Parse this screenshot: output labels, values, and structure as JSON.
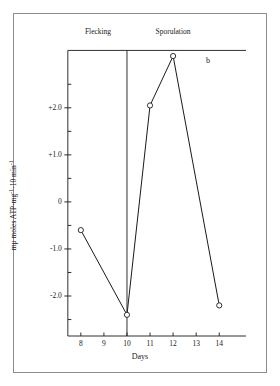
{
  "figure": {
    "panel_label": "b",
    "xlabel": "Days",
    "ylabel_html": "mμ moles ATP·mg⁻¹·10 min⁻¹",
    "region_left": "Flecking",
    "region_right": "Sporulation"
  },
  "chart_data": {
    "type": "line",
    "title": "",
    "subtitle": "",
    "xlabel": "Days",
    "ylabel": "mμ moles ATP·mg⁻¹·10 min⁻¹",
    "xlim": [
      7.4,
      14.9
    ],
    "ylim": [
      -2.85,
      3.25
    ],
    "grid": false,
    "legend": "none",
    "marker": "open-circle",
    "x": [
      8,
      10,
      11,
      12,
      14
    ],
    "values": [
      -0.6,
      -2.4,
      2.05,
      3.1,
      -2.2
    ],
    "series": [
      {
        "name": "ATP activity",
        "points": [
          {
            "x": 8,
            "y": -0.6
          },
          {
            "x": 10,
            "y": -2.4
          },
          {
            "x": 11,
            "y": 2.05
          },
          {
            "x": 12,
            "y": 3.1
          },
          {
            "x": 14,
            "y": -2.2
          }
        ]
      }
    ],
    "x_ticks": [
      8,
      9,
      10,
      11,
      12,
      13,
      14
    ],
    "x_tick_labels": [
      "8",
      "9",
      "10",
      "11",
      "12",
      "13",
      "14"
    ],
    "y_ticks": [
      2.0,
      1.0,
      0,
      -1.0,
      -2.0
    ],
    "y_tick_labels": [
      "+2.0",
      "+1.0",
      "0",
      "-1.0",
      "-2.0"
    ],
    "y_minor_ticks": [
      2.5,
      1.5,
      0.5,
      -0.5,
      -1.5,
      -2.5
    ],
    "annotations": [
      {
        "text": "Flecking",
        "x_range": [
          7.4,
          10
        ]
      },
      {
        "text": "Sporulation",
        "x_range": [
          10,
          14.9
        ]
      },
      {
        "text": "b",
        "x": 13.6,
        "y": 2.6
      }
    ],
    "divider_x": 10,
    "top_rule_y": 3.22
  }
}
